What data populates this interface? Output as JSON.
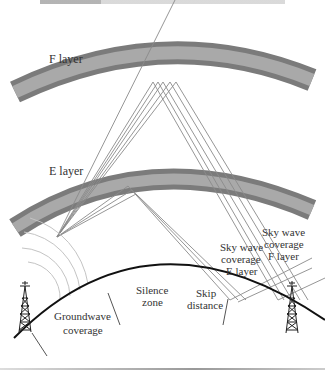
{
  "header": {
    "title_cropped": "WIRELESS ..."
  },
  "diagram": {
    "layers": [
      {
        "id": "f",
        "label": "F layer"
      },
      {
        "id": "e",
        "label": "E layer"
      }
    ],
    "labels": {
      "groundwave_line1": "Groundwave",
      "groundwave_line2": "coverage",
      "silence_line1": "Silence",
      "silence_line2": "zone",
      "skip_line1": "Skip",
      "skip_line2": "distance",
      "sky_e_line1": "Sky wave",
      "sky_e_line2": "coverage",
      "sky_e_line3": "E layer",
      "sky_f_line1": "Sky wave",
      "sky_f_line2": "coverage",
      "sky_f_line3": "F layer"
    },
    "colors": {
      "layer_outer": "#7b7b7b",
      "layer_inner": "#a9a9a9",
      "ray": "#8a8a8a",
      "earth": "#111111",
      "text": "#333333"
    }
  }
}
